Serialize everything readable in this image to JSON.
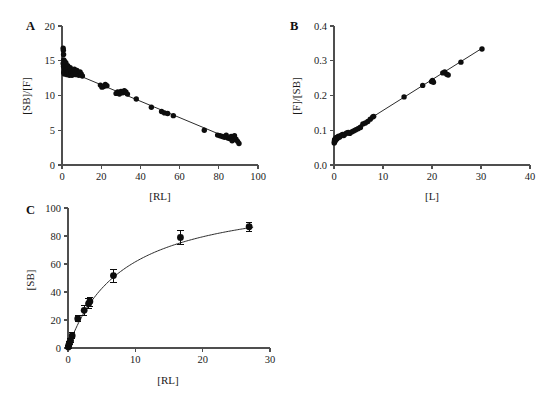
{
  "figure": {
    "background": "#ffffff",
    "point_color": "#0d0d0d",
    "axis_color": "#4f4f4f",
    "curve_color": "#2b2b2b"
  },
  "panels": [
    {
      "id": "a",
      "letter": "A",
      "chart_data": {
        "type": "scatter",
        "title": "",
        "xlabel": "[RL]",
        "ylabel": "[SB]/[F]",
        "xlim": [
          0,
          100
        ],
        "ylim": [
          0,
          20
        ],
        "xticks": [
          0,
          20,
          40,
          60,
          80,
          100
        ],
        "yticks": [
          0,
          5,
          10,
          15,
          20
        ],
        "grid": false,
        "legend": "none",
        "fit": {
          "type": "linear",
          "intercept": 13.9,
          "slope": -0.118,
          "x_from": 0.5,
          "x_to": 91
        },
        "points": [
          [
            0.6,
            16.8
          ],
          [
            0.7,
            16.5
          ],
          [
            0.8,
            15.9
          ],
          [
            0.9,
            15.1
          ],
          [
            0.6,
            14.6
          ],
          [
            0.8,
            14.2
          ],
          [
            1.0,
            14.0
          ],
          [
            1.1,
            13.6
          ],
          [
            0.9,
            13.3
          ],
          [
            1.2,
            13.1
          ],
          [
            1.4,
            14.9
          ],
          [
            1.5,
            14.4
          ],
          [
            1.6,
            13.9
          ],
          [
            1.7,
            13.5
          ],
          [
            1.8,
            13.2
          ],
          [
            2.0,
            14.7
          ],
          [
            2.1,
            14.1
          ],
          [
            2.3,
            13.7
          ],
          [
            2.4,
            13.3
          ],
          [
            2.6,
            13.0
          ],
          [
            2.9,
            14.3
          ],
          [
            3.1,
            13.8
          ],
          [
            3.3,
            13.4
          ],
          [
            3.5,
            13.1
          ],
          [
            3.8,
            12.9
          ],
          [
            4.2,
            14.0
          ],
          [
            4.5,
            13.6
          ],
          [
            4.8,
            13.2
          ],
          [
            5.1,
            12.9
          ],
          [
            5.5,
            13.5
          ],
          [
            5.9,
            13.1
          ],
          [
            6.3,
            13.8
          ],
          [
            6.7,
            13.4
          ],
          [
            7.1,
            13.0
          ],
          [
            7.6,
            13.6
          ],
          [
            8.1,
            13.2
          ],
          [
            8.6,
            12.9
          ],
          [
            9.2,
            13.4
          ],
          [
            9.8,
            13.1
          ],
          [
            10.4,
            12.8
          ],
          [
            19.6,
            11.5
          ],
          [
            20.4,
            11.2
          ],
          [
            21.3,
            11.3
          ],
          [
            22.1,
            11.6
          ],
          [
            22.9,
            11.4
          ],
          [
            27.6,
            10.3
          ],
          [
            28.4,
            10.5
          ],
          [
            29.3,
            10.2
          ],
          [
            30.1,
            10.6
          ],
          [
            31.0,
            10.4
          ],
          [
            31.8,
            10.7
          ],
          [
            32.6,
            10.5
          ],
          [
            33.4,
            10.2
          ],
          [
            37.9,
            9.5
          ],
          [
            45.6,
            8.3
          ],
          [
            50.8,
            7.7
          ],
          [
            52.3,
            7.5
          ],
          [
            53.9,
            7.4
          ],
          [
            56.8,
            7.1
          ],
          [
            72.6,
            5.0
          ],
          [
            79.4,
            4.3
          ],
          [
            80.6,
            4.2
          ],
          [
            81.8,
            4.1
          ],
          [
            82.9,
            4.0
          ],
          [
            83.8,
            4.3
          ],
          [
            84.6,
            3.9
          ],
          [
            85.4,
            3.8
          ],
          [
            86.3,
            4.1
          ],
          [
            87.1,
            3.6
          ],
          [
            88.0,
            4.2
          ],
          [
            88.8,
            3.7
          ],
          [
            89.6,
            3.4
          ],
          [
            90.3,
            3.1
          ],
          [
            86.8,
            3.5
          ]
        ]
      }
    },
    {
      "id": "b",
      "letter": "B",
      "chart_data": {
        "type": "scatter",
        "title": "",
        "xlabel": "[L]",
        "ylabel": "[F]/[SB]",
        "xlim": [
          0,
          40
        ],
        "ylim": [
          0.0,
          0.4
        ],
        "xticks": [
          0,
          10,
          20,
          30,
          40
        ],
        "yticks": [
          0.0,
          0.1,
          0.2,
          0.3,
          0.4
        ],
        "grid": false,
        "legend": "none",
        "fit": {
          "type": "linear",
          "intercept": 0.0685,
          "slope": 0.00885,
          "x_from": 0.0,
          "x_to": 30.5
        },
        "points": [
          [
            0.05,
            0.063
          ],
          [
            0.08,
            0.066
          ],
          [
            0.1,
            0.069
          ],
          [
            0.12,
            0.072
          ],
          [
            0.15,
            0.067
          ],
          [
            0.18,
            0.07
          ],
          [
            0.22,
            0.073
          ],
          [
            0.26,
            0.076
          ],
          [
            0.3,
            0.071
          ],
          [
            0.36,
            0.074
          ],
          [
            0.42,
            0.077
          ],
          [
            0.5,
            0.079
          ],
          [
            0.58,
            0.075
          ],
          [
            0.68,
            0.078
          ],
          [
            0.8,
            0.081
          ],
          [
            0.95,
            0.083
          ],
          [
            1.1,
            0.08
          ],
          [
            1.3,
            0.083
          ],
          [
            1.5,
            0.086
          ],
          [
            1.75,
            0.088
          ],
          [
            2.0,
            0.085
          ],
          [
            2.3,
            0.089
          ],
          [
            2.6,
            0.092
          ],
          [
            2.9,
            0.094
          ],
          [
            3.2,
            0.091
          ],
          [
            3.6,
            0.095
          ],
          [
            4.0,
            0.098
          ],
          [
            4.4,
            0.101
          ],
          [
            4.9,
            0.104
          ],
          [
            5.4,
            0.108
          ],
          [
            5.9,
            0.118
          ],
          [
            6.4,
            0.121
          ],
          [
            6.9,
            0.125
          ],
          [
            7.4,
            0.132
          ],
          [
            7.9,
            0.138
          ],
          [
            8.1,
            0.14
          ],
          [
            14.3,
            0.196
          ],
          [
            18.1,
            0.229
          ],
          [
            19.9,
            0.24
          ],
          [
            20.1,
            0.243
          ],
          [
            20.3,
            0.238
          ],
          [
            22.2,
            0.265
          ],
          [
            22.6,
            0.268
          ],
          [
            23.0,
            0.261
          ],
          [
            23.3,
            0.259
          ],
          [
            25.9,
            0.296
          ],
          [
            30.2,
            0.334
          ]
        ]
      }
    },
    {
      "id": "c",
      "letter": "C",
      "chart_data": {
        "type": "scatter",
        "title": "",
        "xlabel": "[RL]",
        "ylabel": "[SB]",
        "xlim": [
          0,
          30
        ],
        "ylim": [
          0,
          100
        ],
        "xticks": [
          0,
          10,
          20,
          30
        ],
        "yticks": [
          0,
          20,
          40,
          60,
          80,
          100
        ],
        "grid": false,
        "legend": "none",
        "fit": {
          "type": "hyperbola",
          "bmax": 112,
          "kd": 8.2,
          "x_from": 0.0,
          "x_to": 27.5
        },
        "points": [
          {
            "x": 0.05,
            "y": 0.8,
            "err": 0.8
          },
          {
            "x": 0.12,
            "y": 2.2,
            "err": 1.2
          },
          {
            "x": 0.22,
            "y": 3.6,
            "err": 1.4
          },
          {
            "x": 0.38,
            "y": 5.4,
            "err": 1.6
          },
          {
            "x": 0.62,
            "y": 8.8,
            "err": 2.0
          },
          {
            "x": 1.45,
            "y": 20.9,
            "err": 2.2
          },
          {
            "x": 2.4,
            "y": 26.9,
            "err": 3.4
          },
          {
            "x": 3.05,
            "y": 31.6,
            "err": 3.6
          },
          {
            "x": 3.25,
            "y": 33.2,
            "err": 3.2
          },
          {
            "x": 6.75,
            "y": 51.7,
            "err": 4.6
          },
          {
            "x": 16.7,
            "y": 79.0,
            "err": 5.0
          },
          {
            "x": 26.9,
            "y": 86.6,
            "err": 3.4
          }
        ]
      }
    }
  ]
}
